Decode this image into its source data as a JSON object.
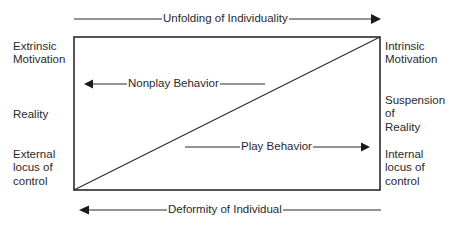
{
  "diagram": {
    "top_arrow": {
      "label": "Unfolding of Individuality",
      "direction": "right"
    },
    "bottom_arrow": {
      "label": "Deformity of Individual",
      "direction": "left"
    },
    "inner_arrows": {
      "nonplay": {
        "label": "Nonplay Behavior",
        "direction": "left"
      },
      "play": {
        "label": "Play Behavior",
        "direction": "right"
      }
    },
    "left_labels": {
      "top": {
        "lines": [
          "Extrinsic",
          "Motivation"
        ]
      },
      "middle": {
        "lines": [
          "Reality"
        ]
      },
      "bottom": {
        "lines": [
          "External",
          "locus of",
          "control"
        ]
      }
    },
    "right_labels": {
      "top": {
        "lines": [
          "Intrinsic",
          "Motivation"
        ]
      },
      "middle": {
        "lines": [
          "Suspension",
          "of",
          "Reality"
        ]
      },
      "bottom": {
        "lines": [
          "Internal",
          "locus of",
          "control"
        ]
      }
    },
    "box": {
      "diagonal": "bottom-left to top-right"
    },
    "colors": {
      "line": "#2a2a2a",
      "background": "#ffffff"
    }
  }
}
